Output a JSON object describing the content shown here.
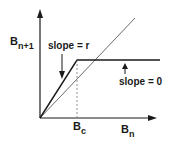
{
  "diagram": {
    "y_axis_label": {
      "base": "B",
      "sub": "n+1"
    },
    "x_axis_label": {
      "base": "B",
      "sub": "n"
    },
    "threshold_label": {
      "base": "B",
      "sub": "c"
    },
    "annotations": {
      "slope_r": "slope = r",
      "slope_0": "slope = 0"
    },
    "colors": {
      "line": "#1a1a1a",
      "thin_line": "#444444",
      "dashed": "#777777",
      "background": "#ffffff"
    },
    "elements": [
      "y-axis arrow",
      "x-axis arrow",
      "45-degree reference line",
      "piecewise line: slope r up to Bc then flat (slope 0)",
      "dashed vertical guide at Bc"
    ]
  }
}
